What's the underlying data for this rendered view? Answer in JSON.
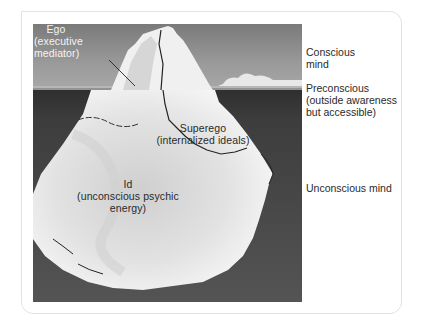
{
  "figure": {
    "colors": {
      "sky": "#8c8c8c",
      "water": "#474747",
      "ice_light": "#f2f2f2",
      "ice_shadow": "#c8c8c8",
      "card_border": "#e2e2e2",
      "text": "#2a2a2a"
    },
    "iceberg_labels": {
      "ego": {
        "title": "Ego",
        "subtitle_1": "(executive",
        "subtitle_2": "mediator)"
      },
      "superego": {
        "title": "Superego",
        "subtitle": "(internalized ideals)"
      },
      "id": {
        "title": "Id",
        "subtitle_1": "(unconscious psychic",
        "subtitle_2": "energy)"
      }
    },
    "levels": {
      "conscious": {
        "line_1": "Conscious",
        "line_2": "mind"
      },
      "preconscious": {
        "line_1": "Preconscious",
        "line_2": "(outside awareness",
        "line_3": "but accessible)"
      },
      "unconscious": {
        "line_1": "Unconscious mind"
      }
    }
  }
}
